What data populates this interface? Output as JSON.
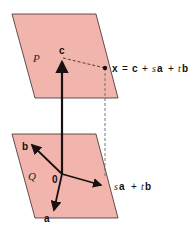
{
  "colors": {
    "plane_fill": "#f2b5ad",
    "plane_stroke": "#3a2a28",
    "vector": "#1a1010",
    "dashed": "#555555"
  },
  "plane_p": {
    "label": "P"
  },
  "plane_q": {
    "label": "Q"
  },
  "vectors": {
    "c": "c",
    "a": "a",
    "b": "b",
    "origin": "0"
  },
  "labels": {
    "x_equation": {
      "x": "x",
      "eq": "=",
      "c": "c",
      "plus1": "+",
      "s": "s",
      "a": "a",
      "plus2": "+",
      "t": "t",
      "b": "b"
    },
    "sa_tb": {
      "s": "s",
      "a": "a",
      "plus": "+",
      "t": "t",
      "b": "b"
    }
  }
}
